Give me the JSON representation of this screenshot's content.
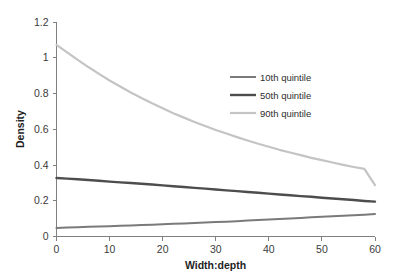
{
  "chart_data": {
    "type": "line",
    "title": "",
    "xlabel": "Width:depth",
    "ylabel": "Density",
    "xlim": [
      0,
      60
    ],
    "ylim": [
      0,
      1.2
    ],
    "xticks": [
      "0",
      "10",
      "20",
      "30",
      "40",
      "50",
      "60"
    ],
    "xtick_values": [
      0,
      10,
      20,
      30,
      40,
      50,
      60
    ],
    "yticks": [
      "0",
      "0.2",
      "0.4",
      "0.6",
      "0.8",
      "1",
      "1.2"
    ],
    "ytick_values": [
      0,
      0.2,
      0.4,
      0.6,
      0.8,
      1,
      1.2
    ],
    "grid": false,
    "legend_position": "upper-right",
    "x": [
      0,
      2,
      4,
      6,
      8,
      10,
      12,
      14,
      16,
      18,
      20,
      22,
      24,
      26,
      28,
      30,
      32,
      34,
      36,
      38,
      40,
      42,
      44,
      46,
      48,
      50,
      52,
      54,
      56,
      58,
      60
    ],
    "series": [
      {
        "name": "10th quintile",
        "color": "#7a7a7a",
        "width": 2.0,
        "values": [
          0.047,
          0.05,
          0.052,
          0.054,
          0.056,
          0.058,
          0.06,
          0.062,
          0.064,
          0.066,
          0.069,
          0.071,
          0.073,
          0.076,
          0.078,
          0.081,
          0.083,
          0.086,
          0.089,
          0.092,
          0.095,
          0.098,
          0.101,
          0.104,
          0.107,
          0.11,
          0.113,
          0.116,
          0.119,
          0.122,
          0.126
        ]
      },
      {
        "name": "50th quintile",
        "color": "#4d4d4d",
        "width": 2.4,
        "values": [
          0.327,
          0.324,
          0.32,
          0.316,
          0.312,
          0.307,
          0.303,
          0.299,
          0.295,
          0.291,
          0.286,
          0.281,
          0.277,
          0.272,
          0.268,
          0.263,
          0.258,
          0.254,
          0.249,
          0.245,
          0.24,
          0.235,
          0.231,
          0.226,
          0.222,
          0.217,
          0.213,
          0.208,
          0.204,
          0.199,
          0.195
        ]
      },
      {
        "name": "90th quintile",
        "color": "#c4c4c4",
        "width": 2.2,
        "values": [
          1.072,
          1.03,
          0.988,
          0.948,
          0.91,
          0.873,
          0.839,
          0.806,
          0.775,
          0.745,
          0.717,
          0.69,
          0.665,
          0.641,
          0.618,
          0.596,
          0.576,
          0.556,
          0.537,
          0.519,
          0.502,
          0.485,
          0.47,
          0.455,
          0.44,
          0.427,
          0.414,
          0.401,
          0.389,
          0.378,
          0.287
        ]
      }
    ]
  },
  "legend": {
    "items": [
      {
        "label": "10th quintile"
      },
      {
        "label": "50th quintile"
      },
      {
        "label": "90th quintile"
      }
    ]
  },
  "colors": {
    "background": "#ffffff",
    "axis": "#808080",
    "text": "#2e2e2e"
  }
}
